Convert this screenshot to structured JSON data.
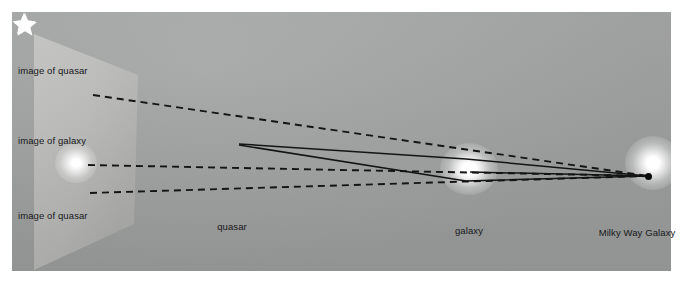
{
  "figure": {
    "type": "gravitational-lensing-diagram",
    "background_color": "#ffffff",
    "panel_color": "#a3a5a4",
    "image_plane_color": "#bcbdbb",
    "line_color": "#141414",
    "star_color": "#ffffff"
  },
  "labels": {
    "image_of_quasar_top": "image of quasar",
    "image_of_galaxy": "image of galaxy",
    "image_of_quasar_bottom": "image of quasar",
    "quasar": "quasar",
    "galaxy": "galaxy",
    "milky_way": "Milky Way Galaxy"
  },
  "objects": [
    {
      "name": "image-of-quasar-top",
      "kind": "star",
      "x": 81,
      "y": 94
    },
    {
      "name": "image-of-galaxy",
      "kind": "glow",
      "x": 76,
      "y": 163
    },
    {
      "name": "image-of-quasar-bottom",
      "kind": "star",
      "x": 78,
      "y": 192
    },
    {
      "name": "quasar",
      "kind": "star",
      "x": 233,
      "y": 143
    },
    {
      "name": "galaxy",
      "kind": "glow",
      "x": 469,
      "y": 169
    },
    {
      "name": "milky-way-galaxy",
      "kind": "glow",
      "x": 653,
      "y": 163
    },
    {
      "name": "observer",
      "kind": "dot",
      "x": 648,
      "y": 176
    }
  ],
  "label_positions": [
    {
      "name": "image-of-quasar-top",
      "x": 18,
      "y": 66,
      "align": "left"
    },
    {
      "name": "image-of-galaxy",
      "x": 18,
      "y": 136,
      "align": "left"
    },
    {
      "name": "image-of-quasar-bottom",
      "x": 18,
      "y": 211,
      "align": "left"
    },
    {
      "name": "quasar",
      "x": 232,
      "y": 222,
      "align": "center"
    },
    {
      "name": "galaxy",
      "x": 469,
      "y": 226,
      "align": "center"
    },
    {
      "name": "milky-way-galaxy",
      "x": 637,
      "y": 228,
      "align": "center"
    }
  ],
  "image_plane": {
    "points": "22,22 126,63 122,212 22,258",
    "description": "light trapezoid representing the apparent sky plane"
  },
  "light_paths": {
    "dashed": [
      {
        "name": "sightline-upper-quasar-image",
        "from": [
          93,
          95
        ],
        "to": [
          648,
          176
        ],
        "style": "dashed"
      },
      {
        "name": "sightline-galaxy-image",
        "from": [
          88,
          165
        ],
        "to": [
          648,
          176
        ],
        "style": "dashed"
      },
      {
        "name": "sightline-lower-quasar-image",
        "from": [
          90,
          193
        ],
        "to": [
          648,
          176
        ],
        "style": "dashed"
      }
    ],
    "solid": [
      {
        "name": "ray-quasar-over-galaxy",
        "path": [
          [
            239,
            144
          ],
          [
            466,
            159
          ],
          [
            648,
            176
          ]
        ],
        "style": "solid"
      },
      {
        "name": "ray-quasar-under-galaxy",
        "path": [
          [
            239,
            145
          ],
          [
            466,
            181
          ],
          [
            648,
            176
          ]
        ],
        "style": "solid"
      },
      {
        "name": "ray-galaxy-to-observer",
        "path": [
          [
            470,
            172
          ],
          [
            648,
            176
          ]
        ],
        "style": "solid"
      }
    ]
  }
}
